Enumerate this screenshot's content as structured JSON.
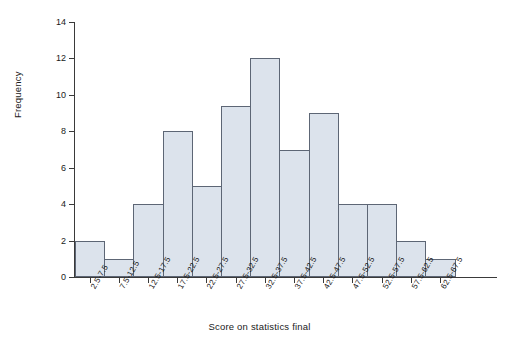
{
  "chart_data": {
    "type": "bar",
    "title": "",
    "subtitle": "",
    "xlabel": "Score on statistics final",
    "ylabel": "Frequency",
    "categories": [
      "2.5-7.5",
      "7.5-12.5",
      "12.5-17.5",
      "17.5-22.5",
      "22.5-27.5",
      "27.5-32.5",
      "32.5-37.5",
      "37.5-42.5",
      "42.5-47.5",
      "47.5-52.5",
      "52.5-57.5",
      "57.5-62.5",
      "62.5-67.5"
    ],
    "values": [
      2,
      1,
      4,
      8,
      5,
      9.4,
      12,
      7,
      9,
      4,
      4,
      2,
      1
    ],
    "ylim": [
      0,
      14
    ],
    "ytick_labels": [
      "0",
      "2",
      "4",
      "6",
      "8",
      "10",
      "12",
      "14"
    ],
    "ytick_values": [
      0,
      2,
      4,
      6,
      8,
      10,
      12,
      14
    ],
    "grid": false,
    "legend": "none",
    "bar_fill_color": "#dce3ec",
    "bar_edge_color": "#5d6675",
    "axis_color": "#3a3a3a"
  }
}
